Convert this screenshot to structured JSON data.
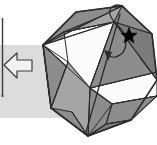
{
  "figure": {
    "title": "Octagonal folding diagram",
    "width": 157,
    "height": 145
  },
  "colors": {
    "background": "#ffffff",
    "band": "#dcdcdc",
    "facet_fill": "#8d8d8d",
    "facet_fill_light": "#a5a5a5",
    "facet_fill_dark": "#7b7b7b",
    "facet_white": "#fbfbfb",
    "outline": "#2b2b2b",
    "star": "#000000",
    "arrow_fill": "#f2f2f2",
    "arrow_stroke": "#3a3a3a",
    "rule_line": "#3a3a3a"
  },
  "band": {
    "label": "horizontal-gray-band",
    "x": 0,
    "y": 45,
    "width": 74,
    "height": 73
  },
  "rule": {
    "label": "vertical-rule",
    "x": 2.5,
    "y1": 18,
    "y2": 96
  },
  "arrow": {
    "label": "left-pointing-block-arrow",
    "direction": "left",
    "points": "4,65 17,53 17,60 32,60 32,71 17,71 17,78"
  },
  "octagon": {
    "label": "octagon-outline",
    "points": "43,45 76,12 122,6 152,34 157,80 131,120 88,136 51,108"
  },
  "facets": [
    {
      "name": "facet-top-left",
      "points": "43,45 76,12 122,6 112,12 64,32",
      "fill": "#8d8d8d"
    },
    {
      "name": "facet-top-wedge",
      "points": "64,32 112,12 122,6 152,34 114,22",
      "fill": "#8d8d8d"
    },
    {
      "name": "facet-top-right",
      "points": "114,22 152,34 157,80 140,58 118,30",
      "fill": "#7b7b7b"
    },
    {
      "name": "facet-upper-center",
      "points": "43,45 64,32 114,22 122,6 43,45",
      "fill": "#a5a5a5"
    },
    {
      "name": "facet-left-upper",
      "points": "43,45 64,32 68,62 43,45",
      "fill": "#8d8d8d"
    },
    {
      "name": "facet-left-lower",
      "points": "43,45 51,108 68,62",
      "fill": "#8d8d8d"
    },
    {
      "name": "facet-left-edge",
      "points": "43,45 51,108 43,45",
      "fill": "#8d8d8d"
    },
    {
      "name": "facet-center-white",
      "points": "43,45 114,22 90,88",
      "fill": "#fbfbfb"
    },
    {
      "name": "facet-right-white",
      "points": "90,88 157,72 157,96 112,104",
      "fill": "#fbfbfb"
    },
    {
      "name": "facet-mid-right",
      "points": "114,22 157,80 157,72 90,88",
      "fill": "#8d8d8d"
    },
    {
      "name": "facet-bottom-right",
      "points": "112,104 157,96 131,120 106,124",
      "fill": "#8d8d8d"
    },
    {
      "name": "facet-bottom-strip",
      "points": "88,136 131,120 106,124 88,136",
      "fill": "#7b7b7b"
    },
    {
      "name": "facet-bottom-center",
      "points": "88,136 90,88 112,104 106,124",
      "fill": "#8d8d8d"
    },
    {
      "name": "facet-bottom-left",
      "points": "51,108 88,136 90,88 68,62",
      "fill": "#a5a5a5"
    },
    {
      "name": "facet-lower-left",
      "points": "51,108 88,136 72,112",
      "fill": "#8d8d8d"
    }
  ],
  "creases": [
    {
      "name": "crease-hub-left-to-top",
      "x1": 43,
      "y1": 45,
      "x2": 76,
      "y2": 12
    },
    {
      "name": "crease-hub-left-to-topmid",
      "x1": 43,
      "y1": 45,
      "x2": 64,
      "y2": 32
    },
    {
      "name": "crease-hub-left-to-apex",
      "x1": 43,
      "y1": 45,
      "x2": 122,
      "y2": 6
    },
    {
      "name": "crease-hub-left-to-ridge",
      "x1": 43,
      "y1": 45,
      "x2": 114,
      "y2": 22
    },
    {
      "name": "crease-hub-left-to-mid",
      "x1": 43,
      "y1": 45,
      "x2": 90,
      "y2": 88
    },
    {
      "name": "crease-hub-left-to-inner",
      "x1": 43,
      "y1": 45,
      "x2": 68,
      "y2": 62
    },
    {
      "name": "crease-hub-left-down",
      "x1": 43,
      "y1": 45,
      "x2": 51,
      "y2": 108
    },
    {
      "name": "crease-top-edge-inner",
      "x1": 64,
      "y1": 32,
      "x2": 114,
      "y2": 22
    },
    {
      "name": "crease-ridge-right",
      "x1": 114,
      "y1": 22,
      "x2": 157,
      "y2": 80
    },
    {
      "name": "crease-apex-to-right",
      "x1": 122,
      "y1": 6,
      "x2": 152,
      "y2": 34
    },
    {
      "name": "crease-center-diag",
      "x1": 114,
      "y1": 22,
      "x2": 90,
      "y2": 88
    },
    {
      "name": "crease-mid-to-botright",
      "x1": 90,
      "y1": 88,
      "x2": 157,
      "y2": 72
    },
    {
      "name": "crease-mid-to-lowright",
      "x1": 90,
      "y1": 88,
      "x2": 112,
      "y2": 104
    },
    {
      "name": "crease-lowright-edge",
      "x1": 112,
      "y1": 104,
      "x2": 157,
      "y2": 96
    },
    {
      "name": "crease-hub-bottom-up",
      "x1": 88,
      "y1": 136,
      "x2": 90,
      "y2": 88
    },
    {
      "name": "crease-hub-bottom-left",
      "x1": 88,
      "y1": 136,
      "x2": 51,
      "y2": 108
    },
    {
      "name": "crease-hub-bottom-inner",
      "x1": 88,
      "y1": 136,
      "x2": 72,
      "y2": 112
    },
    {
      "name": "crease-hub-bottom-right",
      "x1": 88,
      "y1": 136,
      "x2": 112,
      "y2": 104
    },
    {
      "name": "crease-hub-bottom-far",
      "x1": 88,
      "y1": 136,
      "x2": 131,
      "y2": 120
    },
    {
      "name": "crease-hub-bottom-edge",
      "x1": 88,
      "y1": 136,
      "x2": 106,
      "y2": 124
    },
    {
      "name": "crease-left-inner-vert",
      "x1": 68,
      "y1": 62,
      "x2": 51,
      "y2": 108
    },
    {
      "name": "crease-left-panel",
      "x1": 64,
      "y1": 32,
      "x2": 68,
      "y2": 62
    },
    {
      "name": "crease-bottom-band",
      "x1": 106,
      "y1": 124,
      "x2": 131,
      "y2": 120
    },
    {
      "name": "crease-right-band",
      "x1": 140,
      "y1": 58,
      "x2": 157,
      "y2": 80
    }
  ],
  "fold_arrow": {
    "name": "curved-fold-arrow",
    "loop_path": "M 124,7 C 115,2 106,8 111,17 C 116,26 126,30 126,42 C 126,56 113,60 108,55",
    "stem_path": "M 120,14 L 86,132",
    "head_points": "104,50 112,52 108,61"
  },
  "star": {
    "name": "star-marker",
    "cx": 129,
    "cy": 36,
    "r_outer": 8.5,
    "r_inner": 3.6,
    "points": 5
  }
}
